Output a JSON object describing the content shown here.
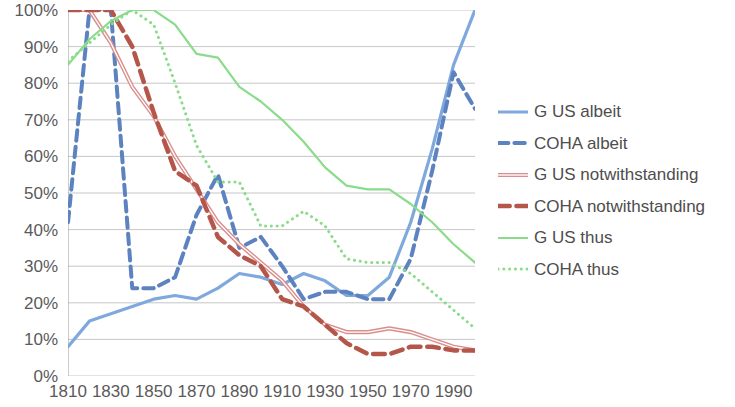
{
  "chart_data": {
    "type": "line",
    "title": "",
    "xlabel": "",
    "ylabel": "",
    "xlim": [
      1810,
      2000
    ],
    "ylim": [
      0,
      1
    ],
    "grid": true,
    "legend_position": "right",
    "y_ticks": [
      "0%",
      "10%",
      "20%",
      "30%",
      "40%",
      "50%",
      "60%",
      "70%",
      "80%",
      "90%",
      "100%"
    ],
    "y_tick_values": [
      0,
      10,
      20,
      30,
      40,
      50,
      60,
      70,
      80,
      90,
      100
    ],
    "x_ticks": [
      "1810",
      "1830",
      "1850",
      "1870",
      "1890",
      "1910",
      "1930",
      "1950",
      "1970",
      "1990"
    ],
    "x_tick_values": [
      1810,
      1830,
      1850,
      1870,
      1890,
      1910,
      1930,
      1950,
      1970,
      1990
    ],
    "x_minor_step": 10,
    "series": [
      {
        "name": "G US albeit",
        "color": "#7fa9dc",
        "style": "solid",
        "width": 3.2,
        "x": [
          1810,
          1820,
          1830,
          1840,
          1850,
          1860,
          1870,
          1880,
          1890,
          1900,
          1910,
          1920,
          1930,
          1940,
          1950,
          1960,
          1970,
          1980,
          1990,
          2000
        ],
        "values": [
          8,
          15,
          17,
          19,
          21,
          22,
          21,
          24,
          28,
          27,
          25,
          28,
          26,
          22,
          22,
          27,
          42,
          62,
          85,
          100
        ]
      },
      {
        "name": "COHA albeit",
        "color": "#5d82c0",
        "style": "dashed",
        "width": 4,
        "x": [
          1810,
          1820,
          1830,
          1840,
          1850,
          1860,
          1870,
          1880,
          1890,
          1900,
          1910,
          1920,
          1930,
          1940,
          1950,
          1960,
          1970,
          1980,
          1990,
          2000
        ],
        "values": [
          42,
          100,
          100,
          24,
          24,
          27,
          44,
          55,
          35,
          38,
          30,
          21,
          23,
          23,
          21,
          21,
          32,
          56,
          83,
          73
        ]
      },
      {
        "name": "G US notwithstanding",
        "color": "#d98e8c",
        "style": "solid-double",
        "width": 1.6,
        "x": [
          1810,
          1820,
          1830,
          1840,
          1850,
          1860,
          1870,
          1880,
          1890,
          1900,
          1910,
          1920,
          1930,
          1940,
          1950,
          1960,
          1970,
          1980,
          1990,
          2000
        ],
        "values": [
          100,
          100,
          91,
          79,
          71,
          60,
          51,
          42,
          36,
          31,
          26,
          19,
          14,
          12,
          12,
          13,
          12,
          10,
          8,
          7
        ]
      },
      {
        "name": "COHA notwithstanding",
        "color": "#b5564b",
        "style": "dashed",
        "width": 4.5,
        "x": [
          1810,
          1820,
          1830,
          1840,
          1850,
          1860,
          1870,
          1880,
          1890,
          1900,
          1910,
          1920,
          1930,
          1940,
          1950,
          1960,
          1970,
          1980,
          1990,
          2000
        ],
        "values": [
          100,
          100,
          100,
          90,
          72,
          56,
          52,
          38,
          33,
          30,
          21,
          19,
          14,
          9,
          6,
          6,
          8,
          8,
          7,
          7
        ]
      },
      {
        "name": "G US thus",
        "color": "#8adc8a",
        "style": "solid",
        "width": 2.2,
        "x": [
          1810,
          1820,
          1830,
          1840,
          1850,
          1860,
          1870,
          1880,
          1890,
          1900,
          1910,
          1920,
          1930,
          1940,
          1950,
          1960,
          1970,
          1980,
          1990,
          2000
        ],
        "values": [
          85,
          92,
          97,
          100,
          100,
          96,
          88,
          87,
          79,
          75,
          70,
          64,
          57,
          52,
          51,
          51,
          47,
          42,
          36,
          31
        ]
      },
      {
        "name": "COHA thus",
        "color": "#8adc8a",
        "style": "dotted",
        "width": 3,
        "x": [
          1810,
          1820,
          1830,
          1840,
          1850,
          1860,
          1870,
          1880,
          1890,
          1900,
          1910,
          1920,
          1930,
          1940,
          1950,
          1960,
          1970,
          1980,
          1990,
          2000
        ],
        "values": [
          86,
          91,
          96,
          100,
          96,
          80,
          63,
          53,
          53,
          41,
          41,
          45,
          41,
          32,
          31,
          31,
          28,
          23,
          18,
          13
        ]
      }
    ]
  },
  "legend": {
    "items": [
      {
        "label": "G US albeit"
      },
      {
        "label": "COHA albeit"
      },
      {
        "label": "G US notwithstanding"
      },
      {
        "label": "COHA notwithstanding"
      },
      {
        "label": "G US thus"
      },
      {
        "label": "COHA thus"
      }
    ]
  }
}
